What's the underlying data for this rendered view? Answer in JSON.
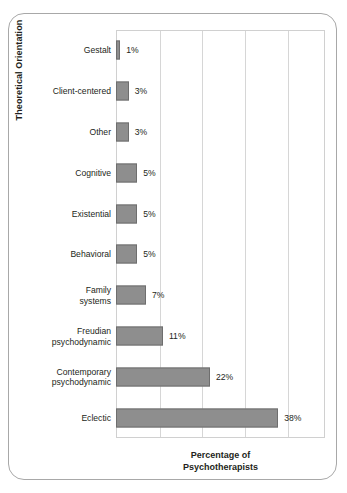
{
  "figure": {
    "frame_color": "#a8a8a8",
    "background": "#ffffff"
  },
  "chart_data": {
    "type": "bar",
    "orientation": "horizontal",
    "title": "",
    "subtitle": "",
    "xlabel_line1": "Percentage of",
    "xlabel_line2": "Psychotherapists",
    "ylabel": "Theoretical Orientation",
    "categories": [
      "Gestalt",
      "Client-centered",
      "Other",
      "Cognitive",
      "Existential",
      "Behavioral",
      "Family systems",
      "Freudian psychodynamic",
      "Contemporary psychodynamic",
      "Eclectic"
    ],
    "category_lines": [
      [
        "Gestalt"
      ],
      [
        "Client-centered"
      ],
      [
        "Other"
      ],
      [
        "Cognitive"
      ],
      [
        "Existential"
      ],
      [
        "Behavioral"
      ],
      [
        "Family",
        "systems"
      ],
      [
        "Freudian",
        "psychodynamic"
      ],
      [
        "Contemporary",
        "psychodynamic"
      ],
      [
        "Eclectic"
      ]
    ],
    "values": [
      1,
      3,
      3,
      5,
      5,
      5,
      7,
      11,
      22,
      38
    ],
    "data_labels": [
      "1%",
      "3%",
      "3%",
      "5%",
      "5%",
      "5%",
      "7%",
      "11%",
      "22%",
      "38%"
    ],
    "xlim": [
      0,
      49
    ],
    "xtick_labels": [],
    "gridlines_x": [
      10,
      20,
      30,
      40
    ],
    "grid": true,
    "legend": null,
    "bar_color": "#8e8e8e",
    "bar_edge_color": "#6e6e6e",
    "grid_color": "#d6d6d6",
    "px_per_percent": 4.27
  }
}
